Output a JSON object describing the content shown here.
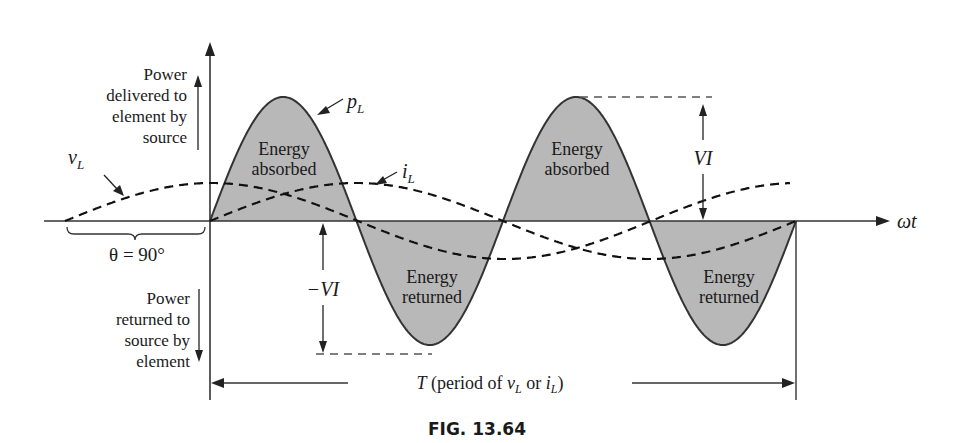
{
  "figure": {
    "caption": "FIG. 13.64",
    "axis_x_label": "ωt",
    "theta_label": "θ = 90°",
    "period_label_prefix": "T (period of ",
    "period_v": "v",
    "period_or": " or ",
    "period_i": "i",
    "period_sub": "L",
    "period_suffix": ")",
    "vi_pos_label": "VI",
    "vi_neg_label": "−VI"
  },
  "labels": {
    "power_delivered": [
      "Power",
      "delivered to",
      "element by",
      "source"
    ],
    "power_returned": [
      "Power",
      "returned to",
      "source by",
      "element"
    ],
    "regions": [
      {
        "line1": "Energy",
        "line2": "absorbed"
      },
      {
        "line1": "Energy",
        "line2": "returned"
      },
      {
        "line1": "Energy",
        "line2": "absorbed"
      },
      {
        "line1": "Energy",
        "line2": "returned"
      }
    ],
    "curve_p": {
      "main": "p",
      "sub": "L"
    },
    "curve_v": {
      "main": "v",
      "sub": "L"
    },
    "curve_i": {
      "main": "i",
      "sub": "L"
    }
  },
  "colors": {
    "fill": "#b8b8b8",
    "line": "#333333",
    "dash": "#111111"
  },
  "chart_data": {
    "type": "line",
    "xlabel": "ωt",
    "series": [
      {
        "name": "p_L",
        "form": "VI·sin(2ωt)",
        "amplitude": "VI",
        "periods_shown": 2
      },
      {
        "name": "v_L",
        "form": "V·sin(ωt + 90°)",
        "style": "dashed"
      },
      {
        "name": "i_L",
        "form": "I·sin(ωt)",
        "style": "dashed"
      }
    ],
    "annotations": [
      "Energy absorbed",
      "Energy returned",
      "Energy absorbed",
      "Energy returned",
      "VI",
      "−VI",
      "θ = 90°",
      "T (period of v_L or i_L)"
    ]
  }
}
